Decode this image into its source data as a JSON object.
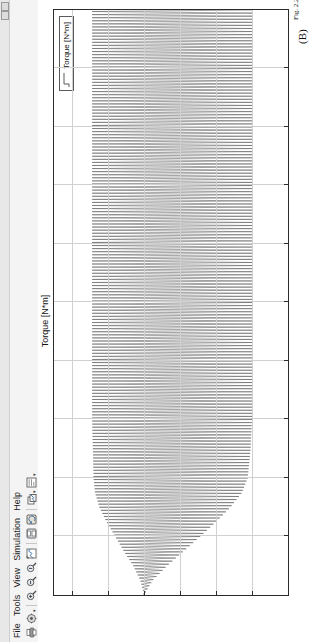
{
  "window": {
    "title_bar_buttons": [
      "minimize",
      "maximize"
    ],
    "menu": [
      {
        "label": "File"
      },
      {
        "label": "Tools"
      },
      {
        "label": "View"
      },
      {
        "label": "Simulation"
      },
      {
        "label": "Help"
      }
    ],
    "toolbar": [
      {
        "name": "print-icon",
        "tooltip": "Print"
      },
      {
        "name": "parameters-icon",
        "tooltip": "Parameters"
      },
      {
        "name": "zoom-in-icon",
        "tooltip": "Zoom in"
      },
      {
        "name": "zoom-x-icon",
        "tooltip": "Zoom X axis"
      },
      {
        "name": "zoom-y-icon",
        "tooltip": "Zoom Y axis"
      },
      {
        "name": "autoscale-icon",
        "tooltip": "Autoscale"
      },
      {
        "name": "save-axes-settings-icon",
        "tooltip": "Save axes settings"
      },
      {
        "name": "restore-axes-settings-icon",
        "tooltip": "Restore axes settings"
      },
      {
        "name": "floating-scope-icon",
        "tooltip": "Floating scope"
      },
      {
        "name": "signal-selection-icon",
        "tooltip": "Signal selection"
      }
    ]
  },
  "plot": {
    "title": "Torque [N*m]",
    "legend": [
      {
        "label": "Torque [N*m]",
        "color": "#5a5a5a"
      }
    ],
    "figure_label": "(B)",
    "caption": "Fig. 2.22 Simulation of torque..."
  },
  "chart_data": {
    "type": "line",
    "title": "Torque [N*m]",
    "xlabel": "",
    "ylabel": "",
    "xlim": [
      0,
      2
    ],
    "ylim": [
      -0.02,
      0.0125
    ],
    "xticks": [
      0.2,
      0.4,
      0.6,
      0.8,
      1,
      1.2,
      1.4,
      1.6,
      1.8,
      2
    ],
    "xticklabels": [
      "0.2",
      "0.4",
      "0.6",
      "0.8",
      "1",
      "1.2",
      "1.4",
      "1.6",
      "1.8",
      "2"
    ],
    "yticks": [
      0.01,
      0.005,
      0,
      -0.005,
      -0.01,
      -0.015,
      -0.02
    ],
    "yticklabels": [
      "0.01",
      "0.005",
      "0",
      "-0.005",
      "-0.01",
      "-0.015",
      "-0.02"
    ],
    "grid": true,
    "legend_position": "top-right",
    "series": [
      {
        "name": "Torque [N*m]",
        "color": "#5a5a5a",
        "description": "High-frequency oscillating torque ripple. Starts at 0, envelope widens rapidly during the first 0.35 s transient, then settles into a steady band.",
        "envelope": {
          "x": [
            0,
            0.05,
            0.1,
            0.15,
            0.2,
            0.25,
            0.3,
            0.35,
            0.4,
            0.5,
            0.6,
            0.8,
            1.0,
            1.2,
            1.4,
            1.6,
            1.8,
            2.0
          ],
          "upper": [
            0.0,
            0.0005,
            0.0015,
            0.0028,
            0.004,
            0.0052,
            0.0062,
            0.0068,
            0.007,
            0.0071,
            0.0072,
            0.0072,
            0.0072,
            0.0072,
            0.0072,
            0.0072,
            0.0072,
            0.0072
          ],
          "lower": [
            0.0,
            -0.0012,
            -0.0032,
            -0.0055,
            -0.0078,
            -0.01,
            -0.012,
            -0.0136,
            -0.0144,
            -0.0148,
            -0.015,
            -0.015,
            -0.015,
            -0.015,
            -0.015,
            -0.015,
            -0.015,
            -0.015
          ]
        },
        "ripple_frequency_hz": 95,
        "mean_steady_state": -0.004
      }
    ]
  }
}
